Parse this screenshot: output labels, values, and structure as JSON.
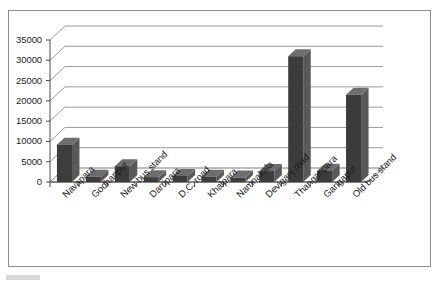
{
  "chart_data": {
    "type": "bar",
    "title": "",
    "subtitle": "",
    "xlabel": "",
    "ylabel": "",
    "categories": [
      "Navapara",
      "Godhanpur",
      "New bus stand",
      "Darripara",
      "D.C. road",
      "Khalpara",
      "Namnakala",
      "Deviganj road",
      "Thanganpara",
      "Gangapur",
      "Old bus stand"
    ],
    "values": [
      9200,
      1300,
      3900,
      1200,
      1500,
      1300,
      1100,
      2700,
      31000,
      2800,
      21500
    ],
    "ylim": [
      0,
      35000
    ],
    "yticks": [
      0,
      5000,
      10000,
      15000,
      20000,
      25000,
      30000,
      35000
    ],
    "ytick_labels": [
      "0",
      "5000",
      "10000",
      "15000",
      "20000",
      "25000",
      "30000",
      "35000"
    ],
    "grid": true,
    "legend": false,
    "legend_position": "none",
    "style": "3d-column",
    "bar_color": "#3c3c3c",
    "bar_side_color": "#595959",
    "bar_top_color": "#6d6d6d",
    "gridline_color": "#9a9a9a",
    "axis_color": "#7d7d7d",
    "plot_background": "#ffffff",
    "frame_color": "#8d8d8d"
  }
}
